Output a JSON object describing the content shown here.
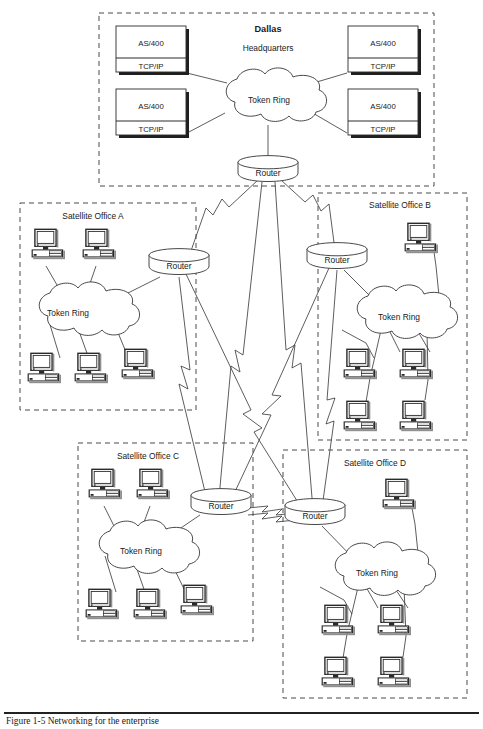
{
  "figure": {
    "type": "network-topology-diagram",
    "caption": "Figure 1-5  Networking for the enterprise",
    "background": "#ffffff",
    "line_color": "#333333",
    "dash_color": "#4a4a4a"
  },
  "zones": [
    {
      "id": "dallas",
      "name": "Dallas",
      "subtitle": "Headquarters",
      "title_bold": true,
      "cloud_label": "Token Ring",
      "router_label": "Router",
      "hosts": [
        {
          "name": "AS/400",
          "protocol": "TCP/IP",
          "position": "top-left"
        },
        {
          "name": "AS/400",
          "protocol": "TCP/IP",
          "position": "top-right"
        },
        {
          "name": "AS/400",
          "protocol": "TCP/IP",
          "position": "bottom-left"
        },
        {
          "name": "AS/400",
          "protocol": "TCP/IP",
          "position": "bottom-right"
        }
      ],
      "host_count": 4
    },
    {
      "id": "office-a",
      "name": "Satellite Office A",
      "cloud_label": "Token Ring",
      "router_label": "Router",
      "workstations_top": 2,
      "workstations_bottom": 3,
      "workstation_count": 5
    },
    {
      "id": "office-b",
      "name": "Satellite Office B",
      "cloud_label": "Token Ring",
      "router_label": "Router",
      "workstations_top": 1,
      "workstations_bottom": 4,
      "workstation_count": 5
    },
    {
      "id": "office-c",
      "name": "Satellite Office C",
      "cloud_label": "Token Ring",
      "router_label": "Router",
      "workstations_top": 2,
      "workstations_bottom": 3,
      "workstation_count": 5
    },
    {
      "id": "office-d",
      "name": "Satellite Office D",
      "cloud_label": "Token Ring",
      "router_label": "Router",
      "workstations_top": 1,
      "workstations_bottom": 4,
      "workstation_count": 5
    }
  ],
  "wan_links": [
    {
      "from": "dallas-router",
      "to": "office-a-router",
      "style": "lightning"
    },
    {
      "from": "dallas-router",
      "to": "office-b-router",
      "style": "lightning"
    },
    {
      "from": "dallas-router",
      "to": "office-c-router",
      "style": "lightning"
    },
    {
      "from": "dallas-router",
      "to": "office-d-router",
      "style": "lightning"
    },
    {
      "from": "office-a-router",
      "to": "office-c-router",
      "style": "lightning"
    },
    {
      "from": "office-a-router",
      "to": "office-d-router",
      "style": "lightning"
    },
    {
      "from": "office-b-router",
      "to": "office-c-router",
      "style": "lightning"
    },
    {
      "from": "office-b-router",
      "to": "office-d-router",
      "style": "lightning"
    },
    {
      "from": "office-c-router",
      "to": "office-d-router",
      "style": "lightning"
    }
  ]
}
